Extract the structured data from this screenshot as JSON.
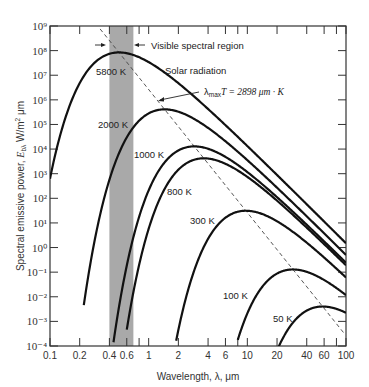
{
  "chart_data": {
    "type": "line",
    "title": "",
    "xlabel": "Wavelength, λ, μm",
    "ylabel": "Spectral emissive power, E_bλ W/m² μm",
    "xscale": "log",
    "yscale": "log",
    "xlim": [
      0.1,
      100
    ],
    "ylim": [
      0.0001,
      1000000000.0
    ],
    "grid": false,
    "x_ticks": [
      0.1,
      0.2,
      0.4,
      0.6,
      1,
      2,
      4,
      6,
      10,
      20,
      40,
      60,
      100
    ],
    "x_tick_labels": [
      "0.1",
      "0.2",
      "0.4",
      "0.6",
      "1",
      "2",
      "4",
      "6",
      "10",
      "20",
      "40",
      "60",
      "100"
    ],
    "x_minor_ticks": [
      0.8,
      8,
      80
    ],
    "y_ticks": [
      -4,
      -3,
      -2,
      -1,
      0,
      1,
      2,
      3,
      4,
      5,
      6,
      7,
      8,
      9
    ],
    "y_tick_labels": [
      "10⁻⁴",
      "10⁻³",
      "10⁻²",
      "10⁻¹",
      "10⁰",
      "10¹",
      "10²",
      "10³",
      "10⁴",
      "10⁵",
      "10⁶",
      "10⁷",
      "10⁸",
      "10⁹"
    ],
    "series": [
      {
        "name": "5800 K",
        "temperature": 5800,
        "lambda_start": 0.1,
        "label_pos": [
          96,
          75
        ]
      },
      {
        "name": "2000 K",
        "temperature": 2000,
        "lambda_start": 0.22,
        "label_pos": [
          98,
          128
        ]
      },
      {
        "name": "1000 K",
        "temperature": 1000,
        "lambda_start": 0.44,
        "label_pos": [
          134,
          158
        ]
      },
      {
        "name": "800 K",
        "temperature": 800,
        "lambda_start": 0.6,
        "label_pos": [
          167,
          195
        ]
      },
      {
        "name": "300 K",
        "temperature": 300,
        "lambda_start": 1.9,
        "label_pos": [
          190,
          224
        ]
      },
      {
        "name": "100 K",
        "temperature": 100,
        "lambda_start": 8.0,
        "label_pos": [
          223,
          299
        ]
      },
      {
        "name": "50 K",
        "temperature": 50,
        "lambda_start": 20.0,
        "label_pos": [
          273,
          322
        ]
      }
    ],
    "planck_constants": {
      "C1": 374200000,
      "C2": 14390
    },
    "wien_line": {
      "label": "λmaxT = 2898 μm · K",
      "constant": 2898
    },
    "visible_band": {
      "lambda_min": 0.4,
      "lambda_max": 0.7,
      "label": "Visible spectral region",
      "color": "#a9a9a9"
    },
    "annotations": [
      {
        "text": "Visible spectral region"
      },
      {
        "text": "Solar radiation"
      },
      {
        "text": "λmaxT = 2898 μm · K"
      }
    ]
  },
  "labels": {
    "visible": "Visible spectral region",
    "solar": "Solar radiation",
    "wien_lambda": "λ",
    "wien_sub": "max",
    "wien_rest": "T = 2898 μm · K",
    "xlabel": "Wavelength, λ, μm",
    "ylabel_a": "Spectral emissive power, ",
    "ylabel_e": "E",
    "ylabel_sub": "bλ",
    "ylabel_b": " W/m",
    "ylabel_sup": "2",
    "ylabel_c": " μm"
  }
}
